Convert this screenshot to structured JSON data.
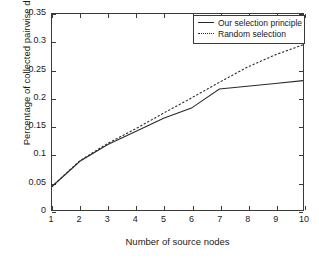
{
  "chart_data": {
    "type": "line",
    "title": "",
    "xlabel": "Number of source nodes",
    "ylabel": "Percentage of collected pairwise distances",
    "x": [
      1,
      2,
      3,
      4,
      5,
      6,
      7,
      8,
      9,
      10
    ],
    "xlim": [
      1,
      10
    ],
    "ylim": [
      0,
      0.35
    ],
    "xticks": [
      "1",
      "2",
      "3",
      "4",
      "5",
      "6",
      "7",
      "8",
      "9",
      "10"
    ],
    "yticks": [
      "0",
      "0.05",
      "0.1",
      "0.15",
      "0.2",
      "0.25",
      "0.3",
      "0.35"
    ],
    "ytick_values": [
      0,
      0.05,
      0.1,
      0.15,
      0.2,
      0.25,
      0.3,
      0.35
    ],
    "grid": false,
    "legend_position": "top-right",
    "series": [
      {
        "name": "Our selection principle",
        "style": "solid",
        "color": "#2a2a2a",
        "values": [
          0.042,
          0.087,
          0.117,
          0.14,
          0.164,
          0.182,
          0.216,
          0.221,
          0.226,
          0.231
        ]
      },
      {
        "name": "Random selection",
        "style": "dotted",
        "color": "#2a2a2a",
        "values": [
          0.042,
          0.088,
          0.119,
          0.145,
          0.173,
          0.2,
          0.228,
          0.255,
          0.277,
          0.295
        ]
      }
    ]
  },
  "legend": {
    "items": [
      {
        "label": "Our selection principle",
        "style": "solid"
      },
      {
        "label": "Random selection",
        "style": "dotted"
      }
    ]
  },
  "axes": {
    "x_title": "Number of source nodes",
    "y_title": "Percentage of collected pairwise distances"
  },
  "colors": {
    "axis": "#3a3a3a",
    "line": "#2a2a2a",
    "background": "#ffffff",
    "text": "#1a1a1a"
  }
}
